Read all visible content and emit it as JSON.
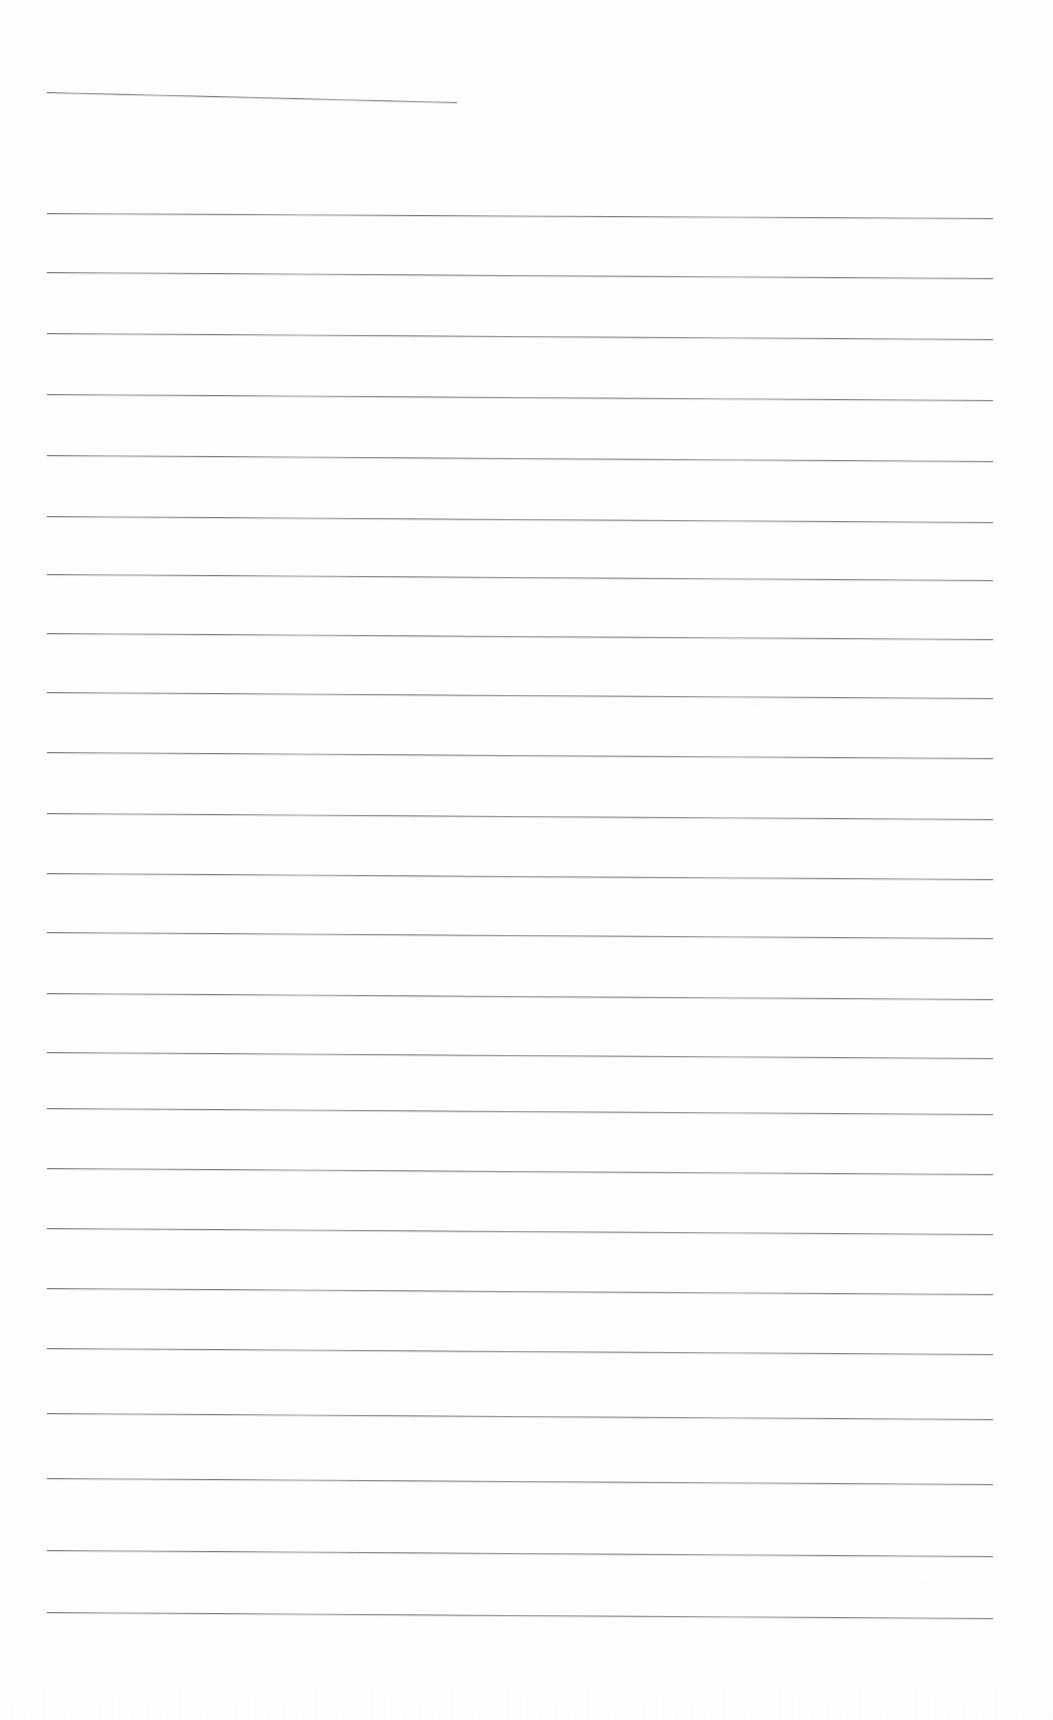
{
  "document": {
    "kind": "scanned-lined-paper",
    "title": "",
    "visible_text": "",
    "page_width": 1053,
    "page_height": 1720,
    "background_color": "#fefefe",
    "rule_color": "#55555a",
    "rule_count": 24,
    "rule_spacing_px": 65,
    "notes_written": ""
  },
  "rules": [
    {
      "index": 1,
      "x": 47,
      "y": 92,
      "width": 410,
      "slope_px": 10,
      "full_width": false
    },
    {
      "index": 2,
      "x": 47,
      "y": 213,
      "width": 946,
      "slope_px": 5,
      "full_width": true
    },
    {
      "index": 3,
      "x": 47,
      "y": 272,
      "width": 946,
      "slope_px": 6,
      "full_width": true
    },
    {
      "index": 4,
      "x": 47,
      "y": 333,
      "width": 946,
      "slope_px": 6,
      "full_width": true
    },
    {
      "index": 5,
      "x": 47,
      "y": 394,
      "width": 946,
      "slope_px": 6,
      "full_width": true
    },
    {
      "index": 6,
      "x": 47,
      "y": 455,
      "width": 946,
      "slope_px": 6,
      "full_width": true
    },
    {
      "index": 7,
      "x": 47,
      "y": 516,
      "width": 946,
      "slope_px": 6,
      "full_width": true
    },
    {
      "index": 8,
      "x": 47,
      "y": 574,
      "width": 946,
      "slope_px": 6,
      "full_width": true
    },
    {
      "index": 9,
      "x": 47,
      "y": 633,
      "width": 946,
      "slope_px": 6,
      "full_width": true
    },
    {
      "index": 10,
      "x": 47,
      "y": 692,
      "width": 946,
      "slope_px": 6,
      "full_width": true
    },
    {
      "index": 11,
      "x": 47,
      "y": 752,
      "width": 946,
      "slope_px": 6,
      "full_width": true
    },
    {
      "index": 12,
      "x": 47,
      "y": 813,
      "width": 946,
      "slope_px": 6,
      "full_width": true
    },
    {
      "index": 13,
      "x": 47,
      "y": 873,
      "width": 946,
      "slope_px": 6,
      "full_width": true
    },
    {
      "index": 14,
      "x": 47,
      "y": 932,
      "width": 946,
      "slope_px": 6,
      "full_width": true
    },
    {
      "index": 15,
      "x": 47,
      "y": 993,
      "width": 946,
      "slope_px": 6,
      "full_width": true
    },
    {
      "index": 16,
      "x": 47,
      "y": 1052,
      "width": 946,
      "slope_px": 6,
      "full_width": true
    },
    {
      "index": 17,
      "x": 47,
      "y": 1108,
      "width": 946,
      "slope_px": 6,
      "full_width": true
    },
    {
      "index": 18,
      "x": 47,
      "y": 1168,
      "width": 946,
      "slope_px": 6,
      "full_width": true
    },
    {
      "index": 19,
      "x": 47,
      "y": 1228,
      "width": 946,
      "slope_px": 6,
      "full_width": true
    },
    {
      "index": 20,
      "x": 47,
      "y": 1288,
      "width": 946,
      "slope_px": 6,
      "full_width": true
    },
    {
      "index": 21,
      "x": 47,
      "y": 1348,
      "width": 946,
      "slope_px": 6,
      "full_width": true
    },
    {
      "index": 22,
      "x": 47,
      "y": 1413,
      "width": 946,
      "slope_px": 6,
      "full_width": true
    },
    {
      "index": 23,
      "x": 47,
      "y": 1478,
      "width": 946,
      "slope_px": 6,
      "full_width": true
    },
    {
      "index": 24,
      "x": 47,
      "y": 1550,
      "width": 946,
      "slope_px": 6,
      "full_width": true
    },
    {
      "index": 25,
      "x": 47,
      "y": 1612,
      "width": 946,
      "slope_px": 6,
      "full_width": true
    }
  ]
}
